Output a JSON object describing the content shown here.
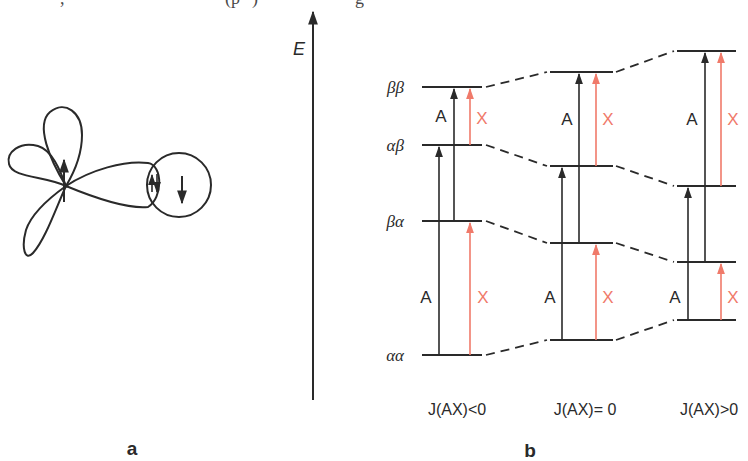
{
  "top_text_fragment": ") ... (p³) ... g",
  "panel_a": {
    "label": "a",
    "description": "Orbital diagram: three-lobed orbital with spin-up arrow, overlapping lobe with circle containing paired arrows and spin-down arrow"
  },
  "energy_axis": {
    "label": "E"
  },
  "panel_b": {
    "label": "b",
    "state_labels": [
      "ββ",
      "αβ",
      "βα",
      "αα"
    ],
    "columns": [
      {
        "caption": "J(AX)<0",
        "levels_y": {
          "bb": 87,
          "ab": 145,
          "ba": 221,
          "aa": 355
        },
        "upper": {
          "A_label": "A",
          "X_label": "X"
        },
        "lower": {
          "A_label": "A",
          "X_label": "X"
        }
      },
      {
        "caption": "J(AX)= 0",
        "levels_y": {
          "bb": 72,
          "ab": 166,
          "ba": 243,
          "aa": 340
        },
        "upper": {
          "A_label": "A",
          "X_label": "X"
        },
        "lower": {
          "A_label": "A",
          "X_label": "X"
        }
      },
      {
        "caption": "J(AX)>0",
        "levels_y": {
          "bb": 51,
          "ab": 186,
          "ba": 262,
          "aa": 320
        },
        "upper": {
          "A_label": "A",
          "X_label": "X"
        },
        "lower": {
          "A_label": "A",
          "X_label": "X"
        }
      }
    ]
  },
  "colors": {
    "line": "#2a2a2a",
    "x_transition": "#f07a6a"
  }
}
